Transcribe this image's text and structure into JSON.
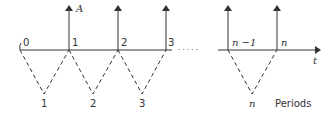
{
  "diagram": {
    "amount_label": "A",
    "time_axis_label": "t",
    "time_points": [
      "0",
      "1",
      "2",
      "3",
      "n −1",
      "n"
    ],
    "period_labels": [
      "1",
      "2",
      "3",
      "n"
    ],
    "periods_caption": "Periods",
    "ellipsis": "· · · · ·",
    "colors": {
      "line": "#333333",
      "background": "#ffffff"
    }
  }
}
